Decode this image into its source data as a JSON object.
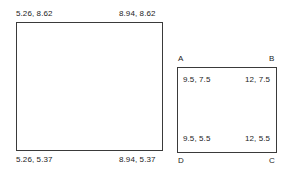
{
  "diagram": {
    "type": "geometry-coordinate-diagram",
    "background_color": "#ffffff",
    "stroke_color": "#3a3a3a",
    "text_color": "#1c1c1c",
    "shapes": [
      {
        "id": "rect-left",
        "name": "left-rectangle",
        "label_placement": "outside",
        "corners": {
          "top_left": "5.26, 8.62",
          "top_right": "8.94, 8.62",
          "bottom_left": "5.26, 5.37",
          "bottom_right": "8.94, 5.37"
        }
      },
      {
        "id": "rect-right",
        "name": "right-rectangle",
        "label_placement": "inside",
        "vertices": {
          "top_left": "A",
          "top_right": "B",
          "bottom_right": "C",
          "bottom_left": "D"
        },
        "corners": {
          "top_left": "9.5, 7.5",
          "top_right": "12, 7.5",
          "bottom_left": "9.5, 5.5",
          "bottom_right": "12, 5.5"
        }
      }
    ]
  }
}
